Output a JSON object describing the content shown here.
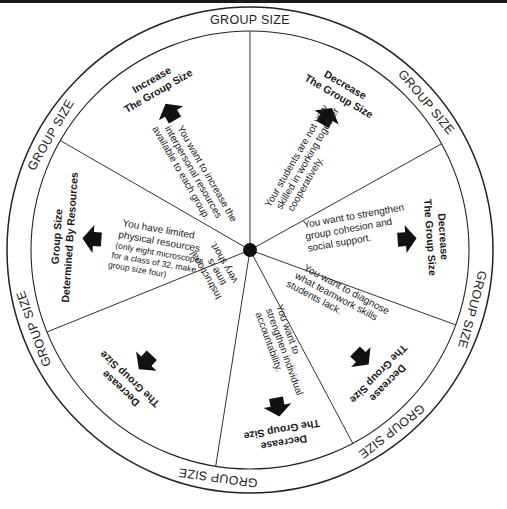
{
  "wheel": {
    "ring_label": "GROUP SIZE",
    "ring_labels": [
      {
        "text": "GROUP SIZE",
        "angle": -90
      },
      {
        "text": "GROUP SIZE",
        "angle": -40
      },
      {
        "text": "GROUP SIZE",
        "angle": 15
      },
      {
        "text": "GROUP SIZE",
        "angle": 52
      },
      {
        "text": "GROUP SIZE",
        "angle": 98
      },
      {
        "text": "GROUP SIZE",
        "angle": 165
      },
      {
        "text": "GROUP SIZE",
        "angle": 210
      }
    ],
    "segments": [
      {
        "id": "increase",
        "action_line1": "Increase",
        "action_line2": "The Group Size",
        "condition_lines": [
          "You want to increase the",
          "interpersonal resources",
          "available to each group."
        ]
      },
      {
        "id": "decrease-skills",
        "action_line1": "Decrease",
        "action_line2": "The Group Size",
        "condition_lines": [
          "Your students are not very",
          "skilled in working together",
          "cooperatively."
        ]
      },
      {
        "id": "decrease-cohesion",
        "action_line1": "Decrease",
        "action_line2": "The Group Size",
        "condition_lines": [
          "You want to strengthen",
          "group cohesion and",
          "social support."
        ]
      },
      {
        "id": "decrease-diagnose",
        "action_line1": "Decrease",
        "action_line2": "The Group Size",
        "condition_lines": [
          "You want to diagnose",
          "what teamwork skills",
          "students lack."
        ]
      },
      {
        "id": "decrease-accountability",
        "action_line1": "Decrease",
        "action_line2": "The Group Size",
        "condition_lines": [
          "You want to",
          "strengthen individual",
          "accountability."
        ]
      },
      {
        "id": "decrease-time",
        "action_line1": "Decrease",
        "action_line2": "The Group Size",
        "condition_lines": [
          "Instructional",
          "time is",
          "very short."
        ]
      },
      {
        "id": "resources",
        "action_line1": "Group Size",
        "action_line2": "Determined By Resources",
        "condition_lines": [
          "You have limited",
          "physical resources"
        ],
        "condition_note_lines": [
          "(only eight microscopes",
          "for a class of 32, make",
          "group size four)"
        ]
      }
    ]
  }
}
